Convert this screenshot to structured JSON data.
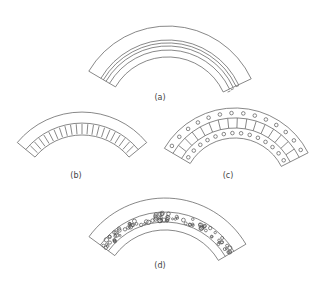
{
  "figure": {
    "panels": [
      {
        "id": "a",
        "label": "(a)",
        "description": "arch with multiple concentric ring courses"
      },
      {
        "id": "b",
        "label": "(b)",
        "description": "arch with radial voussoir band"
      },
      {
        "id": "c",
        "label": "(c)",
        "description": "arch with patterned voussoir blocks in three courses"
      },
      {
        "id": "d",
        "label": "(d)",
        "description": "arch with rubble-filled ring"
      }
    ],
    "colors": {
      "stroke": "#555555",
      "background": "#ffffff",
      "text": "#444444"
    }
  }
}
